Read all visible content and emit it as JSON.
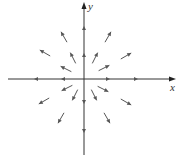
{
  "diagram": {
    "type": "vector-field",
    "origin": [
      84,
      79
    ],
    "axes": {
      "x": {
        "label": "x",
        "from": [
          8,
          79
        ],
        "to": [
          176,
          79
        ]
      },
      "y": {
        "label": "y",
        "from": [
          84,
          155
        ],
        "to": [
          84,
          2
        ]
      }
    },
    "color": "#555555",
    "arrows": [
      {
        "x": 107,
        "y": 79,
        "dx": 1,
        "dy": 0
      },
      {
        "x": 135,
        "y": 79,
        "dx": 1,
        "dy": 0
      },
      {
        "x": 64,
        "y": 79,
        "dx": -1,
        "dy": 0
      },
      {
        "x": 37,
        "y": 79,
        "dx": -1,
        "dy": 0
      },
      {
        "x": 84,
        "y": 56,
        "dx": 0,
        "dy": -1
      },
      {
        "x": 84,
        "y": 29,
        "dx": 0,
        "dy": -1
      },
      {
        "x": 84,
        "y": 101,
        "dx": 0,
        "dy": 1
      },
      {
        "x": 84,
        "y": 130,
        "dx": 0,
        "dy": 1
      },
      {
        "x": 95,
        "y": 58,
        "dx": 0.45,
        "dy": -0.9
      },
      {
        "x": 104,
        "y": 68,
        "dx": 0.9,
        "dy": -0.45
      },
      {
        "x": 73,
        "y": 58,
        "dx": -0.45,
        "dy": -0.9
      },
      {
        "x": 66,
        "y": 69,
        "dx": -0.9,
        "dy": -0.45
      },
      {
        "x": 67,
        "y": 88,
        "dx": -0.9,
        "dy": 0.45
      },
      {
        "x": 75,
        "y": 95,
        "dx": -0.45,
        "dy": 0.9
      },
      {
        "x": 94,
        "y": 95,
        "dx": 0.45,
        "dy": 0.9
      },
      {
        "x": 103,
        "y": 89,
        "dx": 0.9,
        "dy": 0.45
      },
      {
        "x": 108,
        "y": 37,
        "dx": 0.5,
        "dy": -0.87
      },
      {
        "x": 126,
        "y": 56,
        "dx": 0.87,
        "dy": -0.5
      },
      {
        "x": 64,
        "y": 37,
        "dx": -0.5,
        "dy": -0.87
      },
      {
        "x": 45,
        "y": 53,
        "dx": -0.87,
        "dy": -0.5
      },
      {
        "x": 44,
        "y": 101,
        "dx": -0.87,
        "dy": 0.5
      },
      {
        "x": 61,
        "y": 118,
        "dx": -0.5,
        "dy": 0.87
      },
      {
        "x": 107,
        "y": 118,
        "dx": 0.5,
        "dy": 0.87
      },
      {
        "x": 126,
        "y": 102,
        "dx": 0.87,
        "dy": 0.5
      }
    ]
  }
}
